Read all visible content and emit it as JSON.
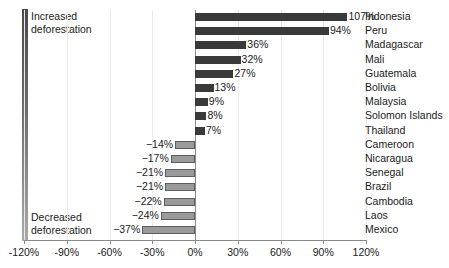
{
  "chart_data": {
    "type": "bar",
    "orientation": "horizontal",
    "title": "",
    "xlabel": "",
    "ylabel": "",
    "xlim": [
      -120,
      120
    ],
    "xticks": [
      "-120%",
      "-90%",
      "-60%",
      "-30%",
      "0%",
      "30%",
      "60%",
      "90%",
      "120%"
    ],
    "xtick_values": [
      -120,
      -90,
      -60,
      -30,
      0,
      30,
      60,
      90,
      120
    ],
    "grid": true,
    "legend_position": "left",
    "categories": [
      "Indonesia",
      "Peru",
      "Madagascar",
      "Mali",
      "Guatemala",
      "Bolivia",
      "Malaysia",
      "Solomon Islands",
      "Thailand",
      "Cameroon",
      "Nicaragua",
      "Senegal",
      "Brazil",
      "Cambodia",
      "Laos",
      "Mexico"
    ],
    "values": [
      107,
      94,
      36,
      32,
      27,
      13,
      9,
      8,
      7,
      -14,
      -17,
      -21,
      -21,
      -22,
      -24,
      -37
    ],
    "value_labels": [
      "107%",
      "94%",
      "36%",
      "32%",
      "27%",
      "13%",
      "9%",
      "8%",
      "7%",
      "−14%",
      "−17%",
      "−21%",
      "−21%",
      "−22%",
      "−24%",
      "−37%"
    ]
  },
  "legend": {
    "top_label": "Increased\ndeforestation",
    "bottom_label": "Decreased\ndeforestation",
    "gradient_top_color": "#4a4a4a",
    "gradient_bottom_color": "#a9a9a9"
  },
  "colors": {
    "positive_bar": "#3a3a3a",
    "negative_bar": "#9a9a9a",
    "negative_bar_border": "#5d5d5d",
    "gridline": "#e9e9e9",
    "axis": "#8a8a8a",
    "text": "#1a1a1a",
    "background": "#ffffff"
  }
}
